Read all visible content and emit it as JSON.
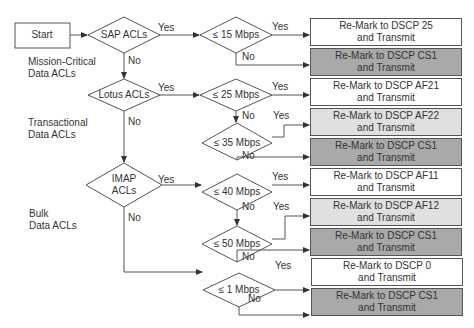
{
  "start": "Start",
  "colors": {
    "white": "#ffffff",
    "light_gray": "#e0e0e0",
    "dark_gray": "#a9a9a9",
    "line": "#555555"
  },
  "categories": [
    {
      "label_line1": "Mission-Critical",
      "label_line2": "Data ACLs"
    },
    {
      "label_line1": "Transactional",
      "label_line2": "Data ACLs"
    },
    {
      "label_line1": "Bulk",
      "label_line2": "Data ACLs"
    }
  ],
  "decisions": {
    "sap": "SAP ACLs",
    "lotus": "Lotus ACLs",
    "imap_1": "IMAP",
    "imap_2": "ACLs",
    "r15": "≤ 15 Mbps",
    "r25": "≤ 25 Mbps",
    "r35": "≤ 35 Mbps",
    "r40": "≤ 40 Mbps",
    "r50": "≤ 50 Mbps",
    "r1": "≤ 1 Mbps"
  },
  "edge_labels": {
    "yes": "Yes",
    "no": "No"
  },
  "actions": [
    {
      "line1": "Re-Mark to DSCP 25",
      "line2": "and Transmit",
      "shade": "white"
    },
    {
      "line1": "Re-Mark to DSCP CS1",
      "line2": "and Transmit",
      "shade": "dark"
    },
    {
      "line1": "Re-Mark to DSCP AF21",
      "line2": "and Transmit",
      "shade": "white"
    },
    {
      "line1": "Re-Mark to DSCP AF22",
      "line2": "and Transmit",
      "shade": "light"
    },
    {
      "line1": "Re-Mark to DSCP CS1",
      "line2": "and Transmit",
      "shade": "dark"
    },
    {
      "line1": "Re-Mark to DSCP AF11",
      "line2": "and Transmit",
      "shade": "white"
    },
    {
      "line1": "Re-Mark to DSCP AF12",
      "line2": "and Transmit",
      "shade": "light"
    },
    {
      "line1": "Re-Mark to DSCP CS1",
      "line2": "and Transmit",
      "shade": "dark"
    },
    {
      "line1": "Re-Mark to DSCP 0",
      "line2": "and Transmit",
      "shade": "white"
    },
    {
      "line1": "Re-Mark to DSCP CS1",
      "line2": "and Transmit",
      "shade": "dark"
    }
  ]
}
